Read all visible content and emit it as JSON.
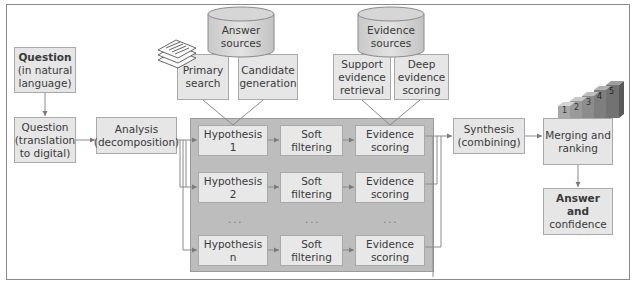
{
  "diagram": {
    "question_natural": {
      "line1": "Question",
      "line2": "(in natural",
      "line3": "language)"
    },
    "question_digital": {
      "line1": "Question",
      "line2": "(translation",
      "line3": "to digital)"
    },
    "analysis": {
      "line1": "Analysis",
      "line2": "(decomposition)"
    },
    "answer_sources": {
      "line1": "Answer",
      "line2": "sources"
    },
    "evidence_sources": {
      "line1": "Evidence",
      "line2": "sources"
    },
    "primary_search": {
      "line1": "Primary",
      "line2": "search"
    },
    "candidate_generation": {
      "line1": "Candidate",
      "line2": "generation"
    },
    "support_evidence": {
      "line1": "Support",
      "line2": "evidence",
      "line3": "retrieval"
    },
    "deep_evidence": {
      "line1": "Deep",
      "line2": "evidence",
      "line3": "scoring"
    },
    "rows": [
      {
        "hypothesis": "Hypothesis 1",
        "filter1": "Soft",
        "filter2": "filtering",
        "score1": "Evidence",
        "score2": "scoring"
      },
      {
        "hypothesis": "Hypothesis 2",
        "filter1": "Soft",
        "filter2": "filtering",
        "score1": "Evidence",
        "score2": "scoring"
      },
      {
        "hypothesis": "Hypothesis n",
        "filter1": "Soft",
        "filter2": "filtering",
        "score1": "Evidence",
        "score2": "scoring"
      }
    ],
    "ellipsis": "...",
    "synthesis": {
      "line1": "Synthesis",
      "line2": "(combining)"
    },
    "merging": {
      "line1": "Merging and",
      "line2": "ranking"
    },
    "answer": {
      "line1": "Answer and",
      "line2": "confidence"
    },
    "rank_steps": [
      "1",
      "2",
      "3",
      "4",
      "5"
    ],
    "colors": {
      "box": "#e6e6e6",
      "panel": "#bdbdbd",
      "line": "#8a8a8a",
      "text": "#3a3a3a"
    }
  }
}
